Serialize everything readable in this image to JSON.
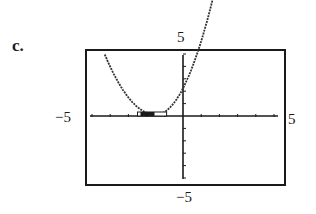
{
  "part_label": "c.",
  "chart_data": {
    "type": "line",
    "title": "",
    "xlabel": "",
    "ylabel": "",
    "xlim": [
      -5,
      5
    ],
    "ylim": [
      -5,
      5
    ],
    "grid": false,
    "window_labels": {
      "ymax": "5",
      "xmin": "−5",
      "xmax": "5",
      "ymin": "−5"
    },
    "x_ticks": [
      -5,
      -4,
      -3,
      -2,
      -1,
      0,
      1,
      2,
      3,
      4,
      5
    ],
    "y_ticks": [
      -5,
      -4,
      -3,
      -2,
      -1,
      0,
      1,
      2,
      3,
      4,
      5
    ],
    "series": [
      {
        "name": "parabola",
        "style": "dotted",
        "vertex": [
          -1.5,
          0.1
        ],
        "x": [
          -4.3,
          -4.0,
          -3.5,
          -3.0,
          -2.5,
          -2.0,
          -1.5,
          -1.0,
          -0.5,
          0.0,
          0.5,
          1.0,
          1.5,
          1.7
        ],
        "y": [
          4.9,
          4.0,
          2.6,
          1.5,
          0.7,
          0.25,
          0.1,
          0.25,
          0.5,
          0.9,
          1.6,
          2.5,
          3.9,
          4.9
        ]
      }
    ],
    "annotations": [
      {
        "type": "highlight-box",
        "x_range": [
          -2.5,
          -0.9
        ],
        "y": 0.1,
        "description": "cursor marker near vertex on x-axis"
      }
    ]
  }
}
